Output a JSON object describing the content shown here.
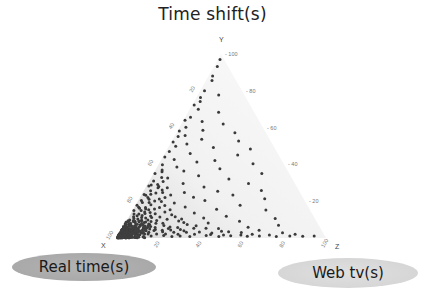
{
  "chart_data": {
    "type": "scatter",
    "subtype": "ternary",
    "axes": {
      "top": {
        "apex_label": "Y",
        "name": "Time shift (s)",
        "ticks": [
          20,
          40,
          60,
          80,
          100
        ]
      },
      "left": {
        "apex_label": "X",
        "name": "Real time (s)",
        "ticks": [
          20,
          40,
          60,
          80,
          100
        ]
      },
      "right": {
        "apex_label": "Z",
        "name": "Web tv (s)",
        "ticks": [
          20,
          40,
          60,
          80,
          100
        ]
      }
    },
    "range": [
      0,
      100
    ],
    "grid": false,
    "point_color": "#3a3a3a",
    "note": "Dense cluster near the X (Real time) corner and along the X–Y edge; sparser points toward Z and Y apex. Points listed as [Y (time shift %), Z (web tv %)] with X = 100 - Y - Z.",
    "points": [
      [
        97,
        1
      ],
      [
        93,
        2
      ],
      [
        88,
        2
      ],
      [
        86,
        3
      ],
      [
        80,
        2
      ],
      [
        78,
        10
      ],
      [
        76,
        2
      ],
      [
        74,
        3
      ],
      [
        72,
        1
      ],
      [
        70,
        4
      ],
      [
        68,
        15
      ],
      [
        66,
        2
      ],
      [
        64,
        1
      ],
      [
        63,
        9
      ],
      [
        62,
        20
      ],
      [
        60,
        3
      ],
      [
        59,
        12
      ],
      [
        58,
        1
      ],
      [
        57,
        28
      ],
      [
        56,
        5
      ],
      [
        55,
        2
      ],
      [
        54,
        14
      ],
      [
        53,
        32
      ],
      [
        52,
        1
      ],
      [
        51,
        8
      ],
      [
        50,
        3
      ],
      [
        49,
        22
      ],
      [
        48,
        40
      ],
      [
        47,
        2
      ],
      [
        46,
        12
      ],
      [
        45,
        35
      ],
      [
        44,
        1
      ],
      [
        43,
        6
      ],
      [
        42,
        26
      ],
      [
        41,
        18
      ],
      [
        40,
        45
      ],
      [
        40,
        2
      ],
      [
        39,
        9
      ],
      [
        38,
        30
      ],
      [
        37,
        3
      ],
      [
        36,
        14
      ],
      [
        35,
        52
      ],
      [
        35,
        1
      ],
      [
        34,
        22
      ],
      [
        33,
        8
      ],
      [
        32,
        38
      ],
      [
        31,
        2
      ],
      [
        30,
        17
      ],
      [
        30,
        48
      ],
      [
        29,
        5
      ],
      [
        28,
        28
      ],
      [
        28,
        1
      ],
      [
        27,
        11
      ],
      [
        26,
        56
      ],
      [
        26,
        3
      ],
      [
        25,
        20
      ],
      [
        25,
        36
      ],
      [
        24,
        7
      ],
      [
        24,
        1
      ],
      [
        23,
        14
      ],
      [
        23,
        44
      ],
      [
        22,
        4
      ],
      [
        22,
        26
      ],
      [
        21,
        10
      ],
      [
        21,
        60
      ],
      [
        20,
        2
      ],
      [
        20,
        32
      ],
      [
        19,
        6
      ],
      [
        19,
        18
      ],
      [
        18,
        1
      ],
      [
        18,
        50
      ],
      [
        17,
        12
      ],
      [
        17,
        24
      ],
      [
        16,
        3
      ],
      [
        16,
        40
      ],
      [
        15,
        8
      ],
      [
        15,
        64
      ],
      [
        15,
        1
      ],
      [
        14,
        16
      ],
      [
        14,
        30
      ],
      [
        13,
        4
      ],
      [
        13,
        20
      ],
      [
        12,
        10
      ],
      [
        12,
        46
      ],
      [
        12,
        2
      ],
      [
        11,
        6
      ],
      [
        11,
        36
      ],
      [
        11,
        70
      ],
      [
        10,
        14
      ],
      [
        10,
        1
      ],
      [
        10,
        26
      ],
      [
        9,
        3
      ],
      [
        9,
        54
      ],
      [
        9,
        9
      ],
      [
        8,
        18
      ],
      [
        8,
        2
      ],
      [
        8,
        40
      ],
      [
        7,
        5
      ],
      [
        7,
        30
      ],
      [
        7,
        12
      ],
      [
        7,
        74
      ],
      [
        6,
        1
      ],
      [
        6,
        22
      ],
      [
        6,
        8
      ],
      [
        6,
        60
      ],
      [
        5,
        3
      ],
      [
        5,
        16
      ],
      [
        5,
        46
      ],
      [
        5,
        34
      ],
      [
        4,
        6
      ],
      [
        4,
        2
      ],
      [
        4,
        24
      ],
      [
        4,
        66
      ],
      [
        4,
        12
      ],
      [
        3,
        1
      ],
      [
        3,
        4
      ],
      [
        3,
        10
      ],
      [
        3,
        20
      ],
      [
        3,
        38
      ],
      [
        3,
        52
      ],
      [
        3,
        78
      ],
      [
        2,
        2
      ],
      [
        2,
        6
      ],
      [
        2,
        14
      ],
      [
        2,
        28
      ],
      [
        2,
        44
      ],
      [
        2,
        58
      ],
      [
        2,
        72
      ],
      [
        2,
        84
      ],
      [
        1,
        1
      ],
      [
        1,
        3
      ],
      [
        1,
        8
      ],
      [
        1,
        16
      ],
      [
        1,
        22
      ],
      [
        1,
        34
      ],
      [
        1,
        48
      ],
      [
        1,
        62
      ],
      [
        1,
        76
      ],
      [
        1,
        88
      ],
      [
        1,
        94
      ],
      [
        28,
        6
      ],
      [
        26,
        9
      ],
      [
        24,
        4
      ],
      [
        22,
        12
      ],
      [
        20,
        8
      ],
      [
        19,
        3
      ],
      [
        18,
        14
      ],
      [
        17,
        5
      ],
      [
        16,
        10
      ],
      [
        15,
        18
      ],
      [
        14,
        6
      ],
      [
        13,
        12
      ],
      [
        12,
        4
      ],
      [
        12,
        22
      ],
      [
        11,
        8
      ],
      [
        11,
        15
      ],
      [
        10,
        5
      ],
      [
        10,
        19
      ],
      [
        9,
        12
      ],
      [
        9,
        25
      ],
      [
        9,
        6
      ],
      [
        8,
        9
      ],
      [
        8,
        15
      ],
      [
        8,
        28
      ],
      [
        7,
        3
      ],
      [
        7,
        8
      ],
      [
        7,
        19
      ],
      [
        7,
        34
      ],
      [
        6,
        4
      ],
      [
        6,
        11
      ],
      [
        6,
        15
      ],
      [
        6,
        26
      ],
      [
        5,
        6
      ],
      [
        5,
        10
      ],
      [
        5,
        22
      ],
      [
        5,
        28
      ],
      [
        5,
        40
      ],
      [
        4,
        4
      ],
      [
        4,
        8
      ],
      [
        4,
        16
      ],
      [
        4,
        20
      ],
      [
        4,
        30
      ],
      [
        4,
        48
      ],
      [
        3,
        2
      ],
      [
        3,
        6
      ],
      [
        3,
        14
      ],
      [
        3,
        26
      ],
      [
        3,
        32
      ],
      [
        3,
        44
      ],
      [
        3,
        58
      ],
      [
        2,
        4
      ],
      [
        2,
        10
      ],
      [
        2,
        18
      ],
      [
        2,
        22
      ],
      [
        2,
        36
      ],
      [
        2,
        50
      ],
      [
        2,
        64
      ],
      [
        1,
        5
      ],
      [
        1,
        12
      ],
      [
        1,
        26
      ],
      [
        1,
        30
      ],
      [
        1,
        42
      ],
      [
        1,
        54
      ],
      [
        1,
        68
      ],
      [
        1,
        82
      ],
      [
        36,
        4
      ],
      [
        33,
        5
      ],
      [
        31,
        7
      ],
      [
        29,
        2
      ],
      [
        27,
        6
      ],
      [
        25,
        9
      ],
      [
        23,
        2
      ],
      [
        21,
        5
      ],
      [
        20,
        11
      ],
      [
        18,
        7
      ],
      [
        17,
        2
      ],
      [
        16,
        6
      ],
      [
        15,
        4
      ],
      [
        14,
        9
      ],
      [
        13,
        2
      ],
      [
        13,
        7
      ],
      [
        12,
        6
      ],
      [
        11,
        3
      ],
      [
        11,
        11
      ],
      [
        10,
        7
      ],
      [
        10,
        10
      ],
      [
        9,
        4
      ],
      [
        9,
        7
      ],
      [
        8,
        5
      ],
      [
        8,
        11
      ],
      [
        7,
        2
      ],
      [
        7,
        6
      ],
      [
        7,
        10
      ],
      [
        6,
        3
      ],
      [
        6,
        6
      ],
      [
        6,
        13
      ],
      [
        5,
        2
      ],
      [
        5,
        4
      ],
      [
        5,
        8
      ],
      [
        5,
        13
      ],
      [
        4,
        3
      ],
      [
        4,
        5
      ],
      [
        4,
        10
      ],
      [
        3,
        3
      ],
      [
        3,
        5
      ],
      [
        3,
        8
      ],
      [
        2,
        3
      ],
      [
        2,
        5
      ],
      [
        2,
        8
      ],
      [
        2,
        12
      ],
      [
        1,
        2
      ],
      [
        1,
        4
      ],
      [
        1,
        6
      ],
      [
        1,
        10
      ]
    ]
  },
  "labels": {
    "title": "Time shift(s)",
    "apex_x": "X",
    "apex_y": "Y",
    "apex_z": "Z",
    "real_time": "Real time(s)",
    "web_tv": "Web tv(s)"
  }
}
